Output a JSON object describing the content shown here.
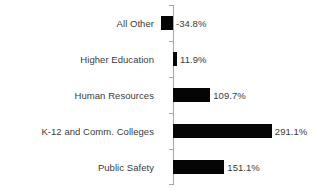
{
  "chart_data": {
    "type": "bar",
    "orientation": "horizontal",
    "title": "",
    "subtitle": "",
    "xlabel": "",
    "ylabel": "",
    "grid": false,
    "legend": "none",
    "axis_line": true,
    "axis_color": "#a6a6a6",
    "bar_color": "#050505",
    "label_color": "#3b3b3b",
    "background": "#ffffff",
    "xlim": [
      -50,
      300
    ],
    "categories": [
      "All Other",
      "Higher Education",
      "Human Resources",
      "K-12 and Comm. Colleges",
      "Public Safety"
    ],
    "values": [
      -34.8,
      11.9,
      109.7,
      291.1,
      151.1
    ],
    "value_labels": [
      "-34.8%",
      "11.9%",
      "109.7%",
      "291.1%",
      "151.1%"
    ],
    "bars": [
      {
        "category": "All Other",
        "value": -34.8,
        "label": "-34.8%"
      },
      {
        "category": "Higher Education",
        "value": 11.9,
        "label": "11.9%"
      },
      {
        "category": "Human Resources",
        "value": 109.7,
        "label": "109.7%"
      },
      {
        "category": "K-12 and Comm. Colleges",
        "value": 291.1,
        "label": "291.1%"
      },
      {
        "category": "Public Safety",
        "value": 151.1,
        "label": "151.1%"
      }
    ]
  }
}
